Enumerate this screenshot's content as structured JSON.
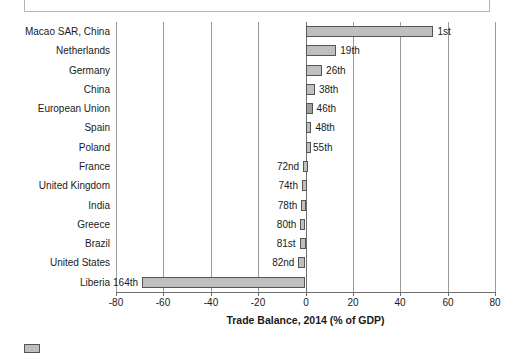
{
  "title_box": {
    "text": ""
  },
  "legend": {
    "label": "",
    "swatch_color": "#bfbfbf"
  },
  "colors": {
    "bar_fill": "#bfbfbf",
    "bar_fill_dark": "#9e9e9e",
    "bar_border": "#555555",
    "gridline": "#9a9a9a",
    "axis": "#6e6e6e"
  },
  "chart_data": {
    "type": "bar",
    "orientation": "horizontal",
    "title": "",
    "xlabel": "Trade Balance, 2014 (% of GDP)",
    "ylabel": "",
    "xlim": [
      -80,
      80
    ],
    "xticks": [
      -80,
      -60,
      -40,
      -20,
      0,
      20,
      40,
      60,
      80
    ],
    "xticklabels": [
      "-80",
      "-60",
      "-40",
      "-20",
      "0",
      "20",
      "40",
      "60",
      "80"
    ],
    "grid": true,
    "legend_position": "bottom-left",
    "categories": [
      "Macao SAR, China",
      "Netherlands",
      "Germany",
      "China",
      "European Union",
      "Spain",
      "Poland",
      "France",
      "United Kingdom",
      "India",
      "Greece",
      "Brazil",
      "United States",
      "Liberia"
    ],
    "values": [
      54,
      13,
      7,
      4,
      3,
      2.5,
      1.5,
      -1,
      -1.5,
      -1.8,
      -2.2,
      -2.5,
      -3,
      -69
    ],
    "annotations": [
      "1st",
      "19th",
      "26th",
      "38th",
      "46th",
      "48th",
      "55th",
      "72nd",
      "74th",
      "78th",
      "80th",
      "81st",
      "82nd",
      "164th"
    ]
  }
}
